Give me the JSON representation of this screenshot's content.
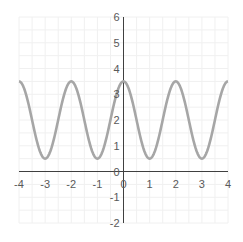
{
  "chart_data": {
    "type": "line",
    "title": "",
    "xlabel": "",
    "ylabel": "",
    "function": "y = 2 + 1.5*cos(pi*x)",
    "xlim": [
      -4,
      4
    ],
    "ylim": [
      -2,
      6
    ],
    "x_ticks": [
      "-4",
      "-3",
      "-2",
      "-1",
      "0",
      "1",
      "2",
      "3",
      "4"
    ],
    "y_ticks": [
      "-2",
      "-1",
      "0",
      "1",
      "2",
      "3",
      "4",
      "5",
      "6"
    ],
    "grid": true,
    "legend": null,
    "series": [
      {
        "name": "curve",
        "color": "#a6a6a6",
        "x": [
          -4,
          -3.5,
          -3,
          -2.5,
          -2,
          -1.5,
          -1,
          -0.5,
          0,
          0.5,
          1,
          1.5,
          2,
          2.5,
          3,
          3.5,
          4
        ],
        "y": [
          3.5,
          2,
          0.5,
          2,
          3.5,
          2,
          0.5,
          2,
          3.5,
          2,
          0.5,
          2,
          3.5,
          2,
          0.5,
          2,
          3.5
        ]
      }
    ],
    "colors": {
      "axis": "#404040",
      "grid": "#f0f0f0",
      "curve": "#a6a6a6",
      "labels": "#595959"
    }
  }
}
